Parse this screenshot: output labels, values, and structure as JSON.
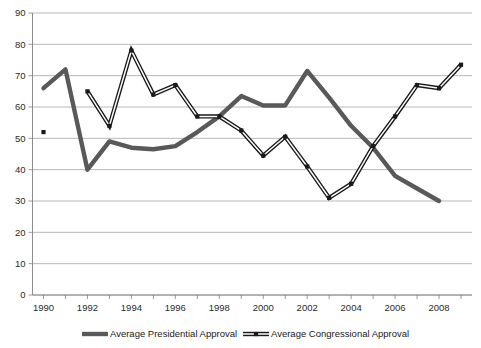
{
  "chart_data": {
    "type": "line",
    "title": "",
    "subtitle": "",
    "xlabel": "",
    "ylabel": "",
    "xlim": [
      1989.5,
      2009.5
    ],
    "ylim": [
      0,
      90
    ],
    "y_ticks": [
      0,
      10,
      20,
      30,
      40,
      50,
      60,
      70,
      80,
      90
    ],
    "y_tick_labels": [
      "0",
      "10",
      "20",
      "30",
      "40",
      "50",
      "60",
      "70",
      "80",
      "90"
    ],
    "x_ticks": [
      1990,
      1991,
      1992,
      1993,
      1994,
      1995,
      1996,
      1997,
      1998,
      1999,
      2000,
      2001,
      2002,
      2003,
      2004,
      2005,
      2006,
      2007,
      2008,
      2009
    ],
    "x_tick_labels": [
      "1990",
      "",
      "1992",
      "",
      "1994",
      "",
      "1996",
      "",
      "1998",
      "",
      "2000",
      "",
      "2002",
      "",
      "2004",
      "",
      "2006",
      "",
      "2008",
      ""
    ],
    "grid": true,
    "grid_axis": "y",
    "legend_position": "bottom",
    "series": [
      {
        "name": "Average Presidential Approval",
        "color": "#595959",
        "marker": "none",
        "x": [
          1990,
          1991,
          1992,
          1993,
          1994,
          1995,
          1996,
          1997,
          1998,
          1999,
          2000,
          2001,
          2002,
          2003,
          2004,
          2005,
          2006,
          2007,
          2008
        ],
        "values": [
          66,
          72,
          40,
          49,
          47,
          46.5,
          47.5,
          52,
          57,
          63.5,
          60.5,
          60.5,
          71.5,
          63,
          54,
          47,
          38,
          34,
          30
        ]
      },
      {
        "name": "Average Congressional Approval",
        "color": "#1a1a1a",
        "marker": "square",
        "x": [
          1990,
          1992,
          1993,
          1994,
          1995,
          1996,
          1997,
          1998,
          1999,
          2000,
          2001,
          2002,
          2003,
          2004,
          2005,
          2006,
          2007,
          2008,
          2009
        ],
        "values": [
          52,
          65,
          54,
          78,
          64,
          67,
          57,
          57,
          52.5,
          44.5,
          50.5,
          41,
          31,
          35.5,
          47.5,
          57,
          67,
          66,
          73.5
        ]
      }
    ]
  },
  "legend": {
    "items": [
      {
        "label": "Average Presidential Approval",
        "swatch": "solid-thick-line"
      },
      {
        "label": "Average Congressional Approval",
        "swatch": "double-line-with-marker"
      }
    ]
  }
}
